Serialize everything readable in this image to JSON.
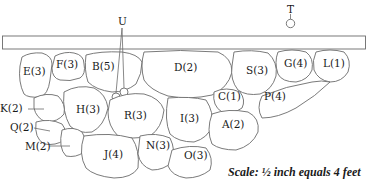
{
  "diagram": {
    "type": "stone-wall-plan",
    "beam": {
      "label": ""
    },
    "markers": {
      "T": {
        "label": "T",
        "x": 290,
        "y": 10
      },
      "U": {
        "label": "U",
        "x": 122,
        "y": 22
      }
    },
    "stones": [
      {
        "id": "E",
        "label": "E(3)",
        "x": 24,
        "y": 75
      },
      {
        "id": "F",
        "label": "F(3)",
        "x": 56,
        "y": 67
      },
      {
        "id": "B",
        "label": "B(5)",
        "x": 92,
        "y": 70
      },
      {
        "id": "D",
        "label": "D(2)",
        "x": 174,
        "y": 71
      },
      {
        "id": "S",
        "label": "S(3)",
        "x": 248,
        "y": 73
      },
      {
        "id": "G",
        "label": "G(4)",
        "x": 285,
        "y": 66
      },
      {
        "id": "L",
        "label": "L(1)",
        "x": 323,
        "y": 66
      },
      {
        "id": "C",
        "label": "C(1)",
        "x": 218,
        "y": 98
      },
      {
        "id": "P",
        "label": "P(4)",
        "x": 265,
        "y": 99
      },
      {
        "id": "K",
        "label": "K(2)",
        "x": 0,
        "y": 112
      },
      {
        "id": "H",
        "label": "H(3)",
        "x": 76,
        "y": 112
      },
      {
        "id": "R",
        "label": "R(3)",
        "x": 125,
        "y": 119
      },
      {
        "id": "I",
        "label": "I(3)",
        "x": 180,
        "y": 120
      },
      {
        "id": "A",
        "label": "A(2)",
        "x": 222,
        "y": 126
      },
      {
        "id": "Q",
        "label": "Q(2)",
        "x": 10,
        "y": 131
      },
      {
        "id": "M",
        "label": "M(2)",
        "x": 25,
        "y": 149
      },
      {
        "id": "N",
        "label": "N(3)",
        "x": 146,
        "y": 149
      },
      {
        "id": "J",
        "label": "J(4)",
        "x": 104,
        "y": 157
      },
      {
        "id": "O",
        "label": "O(3)",
        "x": 184,
        "y": 158
      }
    ],
    "scale_note": "Scale: ½ inch equals 4 feet"
  }
}
